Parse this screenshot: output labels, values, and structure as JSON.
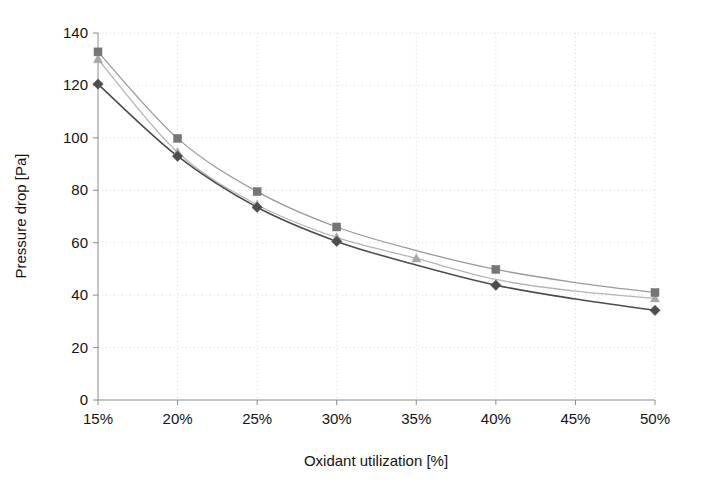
{
  "chart_data": {
    "type": "line",
    "title": "",
    "xlabel": "Oxidant utilization [%]",
    "ylabel": "Pressure drop [Pa]",
    "categories": [
      "15%",
      "20%",
      "25%",
      "30%",
      "35%",
      "40%",
      "45%",
      "50%"
    ],
    "x": [
      15,
      20,
      25,
      30,
      35,
      40,
      45,
      50
    ],
    "xlim": [
      15,
      50
    ],
    "ylim": [
      0,
      140
    ],
    "yticks": [
      0,
      20,
      40,
      60,
      80,
      100,
      120,
      140
    ],
    "ytick_labels": [
      "0",
      "20",
      "40",
      "60",
      "80",
      "100",
      "120",
      "140"
    ],
    "xtick_labels": [
      "15%",
      "20%",
      "25%",
      "30%",
      "35%",
      "40%",
      "45%",
      "50%"
    ],
    "grid": true,
    "grid_style": "dashed",
    "grid_color": "#d8d8d8",
    "legend": "none",
    "series": [
      {
        "name": "series-diamond",
        "marker": "diamond",
        "color": "#4d4d4d",
        "line_color": "#4d4d4d",
        "values": [
          120.5,
          93.0,
          73.5,
          60.5,
          51.5,
          43.8,
          38.5,
          34.2
        ]
      },
      {
        "name": "series-triangle",
        "marker": "triangle",
        "color": "#a8a8a8",
        "line_color": "#b5b5b5",
        "values": [
          130.0,
          94.5,
          74.5,
          62.0,
          54.0,
          46.0,
          41.5,
          38.8
        ]
      },
      {
        "name": "series-square",
        "marker": "square",
        "color": "#767676",
        "line_color": "#9a9a9a",
        "values": [
          132.8,
          99.8,
          79.5,
          66.0,
          57.0,
          49.8,
          44.8,
          41.0
        ]
      }
    ],
    "marker_visibility": {
      "diamond": [
        true,
        true,
        true,
        true,
        false,
        true,
        false,
        true
      ],
      "triangle": [
        true,
        true,
        true,
        true,
        true,
        false,
        false,
        true
      ],
      "square": [
        true,
        true,
        true,
        true,
        false,
        true,
        false,
        true
      ]
    }
  },
  "axis": {
    "x_title": "Oxidant utilization [%]",
    "y_title": "Pressure drop [Pa]"
  }
}
